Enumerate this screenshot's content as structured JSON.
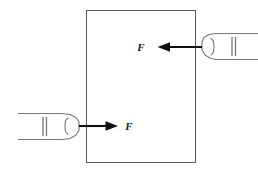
{
  "figure": {
    "background_color": "#ffffff",
    "block": {
      "name": "block",
      "shape": "rectangle",
      "x": 86,
      "y": 10,
      "width": 110,
      "height": 153,
      "stroke_color": "#5a5a5a",
      "fill_color": "#ffffff",
      "stroke_width": 1
    },
    "forces": [
      {
        "id": "force-right",
        "label": "F",
        "direction": "left",
        "arrow_tail_x": 196,
        "arrow_tip_x": 158,
        "arrow_y": 47,
        "label_x": 142,
        "label_y": 51,
        "color": "#111111"
      },
      {
        "id": "force-left",
        "label": "F",
        "direction": "right",
        "arrow_tail_x": 86,
        "arrow_tip_x": 117,
        "arrow_y": 126,
        "label_x": 127,
        "label_y": 130,
        "color": "#111111"
      }
    ],
    "hands": [
      {
        "id": "hand-right",
        "name": "hand-right",
        "side": "right",
        "pointing": "left",
        "stroke_color": "#777777",
        "fingertip_x": 202,
        "fingertip_y": 47,
        "description": "index finger entering from right edge, pressing block"
      },
      {
        "id": "hand-left",
        "name": "hand-left",
        "side": "left",
        "pointing": "right",
        "stroke_color": "#777777",
        "fingertip_x": 80,
        "fingertip_y": 126,
        "description": "index finger entering from left edge, pressing block"
      }
    ],
    "colors": {
      "block_outline": "#5a5a5a",
      "hand_outline": "#777777",
      "arrow": "#111111",
      "label_text": "#1a1a1a"
    }
  }
}
